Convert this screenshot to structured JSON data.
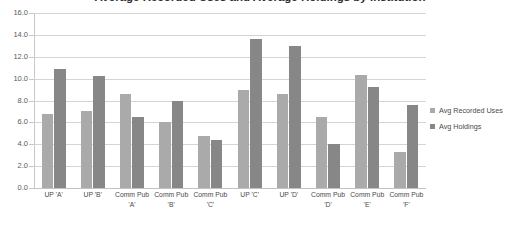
{
  "chart_data": {
    "type": "bar",
    "title": "Average Recorded Uses and Average Holdings by Institution",
    "xlabel": "",
    "ylabel": "",
    "ylim": [
      0.0,
      16.0
    ],
    "ytick_step": 2.0,
    "ytick_labels": [
      "16.0",
      "14.0",
      "12.0",
      "10.0",
      "8.0",
      "6.0",
      "4.0",
      "2.0",
      "0.0"
    ],
    "ytick_values": [
      16.0,
      14.0,
      12.0,
      10.0,
      8.0,
      6.0,
      4.0,
      2.0,
      0.0
    ],
    "grid": true,
    "legend_position": "right",
    "categories": [
      "UP 'A'",
      "UP 'B'",
      "Comm Pub 'A'",
      "Comm Pub 'B'",
      "Comm Pub 'C'",
      "UP 'C'",
      "UP 'D'",
      "Comm Pub 'D'",
      "Comm Pub 'E'",
      "Comm Pub 'F'"
    ],
    "series": [
      {
        "name": "Avg Recorded Uses",
        "color": "#aaaaaa",
        "values": [
          6.8,
          7.0,
          8.6,
          6.0,
          4.8,
          9.0,
          8.6,
          6.5,
          10.3,
          3.3
        ]
      },
      {
        "name": "Avg Holdings",
        "color": "#878787",
        "values": [
          10.9,
          10.2,
          6.5,
          8.0,
          4.4,
          13.6,
          13.0,
          4.0,
          9.2,
          7.6
        ]
      }
    ]
  }
}
